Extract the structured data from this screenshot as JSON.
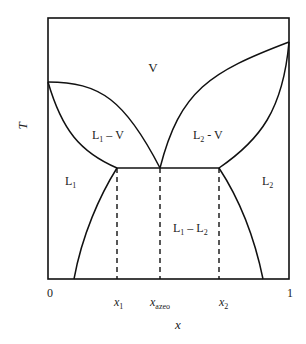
{
  "diagram": {
    "type": "phase-diagram",
    "axes": {
      "x_label": "x",
      "y_label": "T",
      "x_min_label": "0",
      "x_max_label": "1",
      "x_ticks": [
        {
          "main": "x",
          "sub": "1"
        },
        {
          "main": "x",
          "sub": "azeo"
        },
        {
          "main": "x",
          "sub": "2"
        }
      ]
    },
    "regions": {
      "vapor": {
        "main": "V",
        "sub": ""
      },
      "l1_v": {
        "main": "L",
        "sub": "1",
        "rest": " – V"
      },
      "l2_v": {
        "main": "L",
        "sub": "2",
        "rest": " - V"
      },
      "l1": {
        "main": "L",
        "sub": "1"
      },
      "l2": {
        "main": "L",
        "sub": "2"
      },
      "l1_l2": {
        "main": "L",
        "sub": "1",
        "mid": " – L",
        "sub2": "2"
      }
    },
    "colors": {
      "line": "#111111",
      "background": "#ffffff"
    }
  }
}
